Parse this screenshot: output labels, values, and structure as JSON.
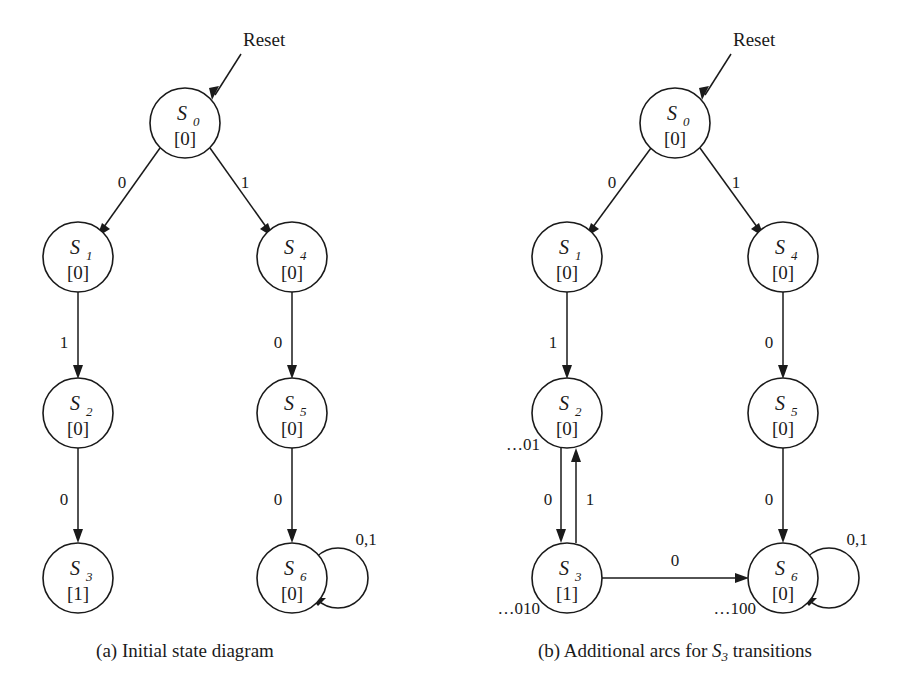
{
  "figure": {
    "background_color": "#ffffff",
    "ink_color": "#1a1a1a",
    "reset_label": "Reset"
  },
  "panels": [
    {
      "id": "panel-a",
      "caption_prefix": "(a)",
      "caption_text": "Initial state diagram",
      "caption_sub": "",
      "caption_tail": "",
      "reset_label": "Reset",
      "states": [
        {
          "id": "S0",
          "name": "S",
          "sub": "0",
          "output": "[0]",
          "cx": 185,
          "cy": 123,
          "r": 35
        },
        {
          "id": "S1",
          "name": "S",
          "sub": "1",
          "output": "[0]",
          "cx": 78,
          "cy": 257,
          "r": 35
        },
        {
          "id": "S4",
          "name": "S",
          "sub": "4",
          "output": "[0]",
          "cx": 292,
          "cy": 257,
          "r": 35
        },
        {
          "id": "S2",
          "name": "S",
          "sub": "2",
          "output": "[0]",
          "cx": 78,
          "cy": 413,
          "r": 35
        },
        {
          "id": "S5",
          "name": "S",
          "sub": "5",
          "output": "[0]",
          "cx": 292,
          "cy": 413,
          "r": 35
        },
        {
          "id": "S3",
          "name": "S",
          "sub": "3",
          "output": "[1]",
          "cx": 78,
          "cy": 578,
          "r": 35
        },
        {
          "id": "S6",
          "name": "S",
          "sub": "6",
          "output": "[0]",
          "cx": 292,
          "cy": 578,
          "r": 35
        }
      ],
      "transitions": [
        {
          "from": "S0",
          "to": "S1",
          "label": "0",
          "label_x": 122,
          "label_y": 188
        },
        {
          "from": "S0",
          "to": "S4",
          "label": "1",
          "label_x": 245,
          "label_y": 188
        },
        {
          "from": "S1",
          "to": "S2",
          "label": "1",
          "label_x": 64,
          "label_y": 348
        },
        {
          "from": "S4",
          "to": "S5",
          "label": "0",
          "label_x": 278,
          "label_y": 348
        },
        {
          "from": "S2",
          "to": "S3",
          "label": "0",
          "label_x": 64,
          "label_y": 505
        },
        {
          "from": "S5",
          "to": "S6",
          "label": "0",
          "label_x": 278,
          "label_y": 505
        },
        {
          "from": "S6",
          "to": "S6",
          "label": "0,1",
          "label_x": 366,
          "label_y": 545,
          "self_loop": true
        }
      ],
      "sequence_labels": []
    },
    {
      "id": "panel-b",
      "caption_prefix": "(b)",
      "caption_text": "Additional arcs for ",
      "caption_sub": "3",
      "caption_tail": " transitions",
      "caption_state": "S",
      "reset_label": "Reset",
      "states": [
        {
          "id": "S0",
          "name": "S",
          "sub": "0",
          "output": "[0]",
          "cx": 675,
          "cy": 123,
          "r": 35
        },
        {
          "id": "S1",
          "name": "S",
          "sub": "1",
          "output": "[0]",
          "cx": 567,
          "cy": 257,
          "r": 35
        },
        {
          "id": "S4",
          "name": "S",
          "sub": "4",
          "output": "[0]",
          "cx": 783,
          "cy": 257,
          "r": 35
        },
        {
          "id": "S2",
          "name": "S",
          "sub": "2",
          "output": "[0]",
          "cx": 567,
          "cy": 413,
          "r": 35
        },
        {
          "id": "S5",
          "name": "S",
          "sub": "5",
          "output": "[0]",
          "cx": 783,
          "cy": 413,
          "r": 35
        },
        {
          "id": "S3",
          "name": "S",
          "sub": "3",
          "output": "[1]",
          "cx": 567,
          "cy": 578,
          "r": 35
        },
        {
          "id": "S6",
          "name": "S",
          "sub": "6",
          "output": "[0]",
          "cx": 783,
          "cy": 578,
          "r": 35
        }
      ],
      "transitions": [
        {
          "from": "S0",
          "to": "S1",
          "label": "0",
          "label_x": 612,
          "label_y": 188
        },
        {
          "from": "S0",
          "to": "S4",
          "label": "1",
          "label_x": 736,
          "label_y": 188
        },
        {
          "from": "S1",
          "to": "S2",
          "label": "1",
          "label_x": 553,
          "label_y": 348
        },
        {
          "from": "S4",
          "to": "S5",
          "label": "0",
          "label_x": 769,
          "label_y": 348
        },
        {
          "from": "S2",
          "to": "S3",
          "label": "0",
          "label_x": 548,
          "label_y": 505
        },
        {
          "from": "S3",
          "to": "S2",
          "label": "1",
          "label_x": 588,
          "label_y": 505
        },
        {
          "from": "S5",
          "to": "S6",
          "label": "0",
          "label_x": 769,
          "label_y": 505
        },
        {
          "from": "S3",
          "to": "S6",
          "label": "0",
          "label_x": 675,
          "label_y": 566
        },
        {
          "from": "S6",
          "to": "S6",
          "label": "0,1",
          "label_x": 857,
          "label_y": 545,
          "self_loop": true
        }
      ],
      "sequence_labels": [
        {
          "text": "…01",
          "x": 540,
          "y": 450,
          "for": "S2"
        },
        {
          "text": "…010",
          "x": 540,
          "y": 614,
          "for": "S3"
        },
        {
          "text": "…100",
          "x": 756,
          "y": 614,
          "for": "S6"
        }
      ]
    }
  ]
}
